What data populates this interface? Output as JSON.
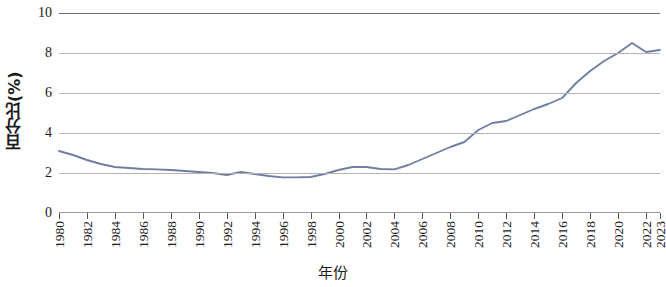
{
  "chart_data": {
    "type": "line",
    "title": "",
    "xlabel": "年份",
    "ylabel": "百分比(%)",
    "xlim": [
      1980,
      2023
    ],
    "ylim": [
      0,
      10
    ],
    "grid": true,
    "legend": "none",
    "line_color": "#6f7fa3",
    "y_ticks": [
      10,
      8,
      6,
      4,
      2,
      0
    ],
    "x_ticks": [
      1980,
      1982,
      1984,
      1986,
      1988,
      1990,
      1992,
      1994,
      1996,
      1998,
      2000,
      2002,
      2004,
      2006,
      2008,
      2010,
      2012,
      2014,
      2016,
      2018,
      2020,
      2022,
      2023
    ],
    "x": [
      1980,
      1981,
      1982,
      1983,
      1984,
      1985,
      1986,
      1987,
      1988,
      1989,
      1990,
      1991,
      1992,
      1993,
      1994,
      1995,
      1996,
      1997,
      1998,
      1999,
      2000,
      2001,
      2002,
      2003,
      2004,
      2005,
      2006,
      2007,
      2008,
      2009,
      2010,
      2011,
      2012,
      2013,
      2014,
      2015,
      2016,
      2017,
      2018,
      2019,
      2020,
      2021,
      2022,
      2023
    ],
    "values": [
      3.1,
      2.9,
      2.65,
      2.45,
      2.3,
      2.25,
      2.2,
      2.18,
      2.15,
      2.1,
      2.05,
      2.0,
      1.9,
      2.05,
      1.95,
      1.85,
      1.78,
      1.78,
      1.8,
      1.95,
      2.15,
      2.3,
      2.3,
      2.2,
      2.18,
      2.4,
      2.7,
      3.0,
      3.3,
      3.55,
      4.15,
      4.5,
      4.6,
      4.9,
      5.2,
      5.45,
      5.75,
      6.5,
      7.1,
      7.6,
      8.0,
      8.5,
      8.05,
      8.15
    ],
    "series_name": "百分比"
  }
}
